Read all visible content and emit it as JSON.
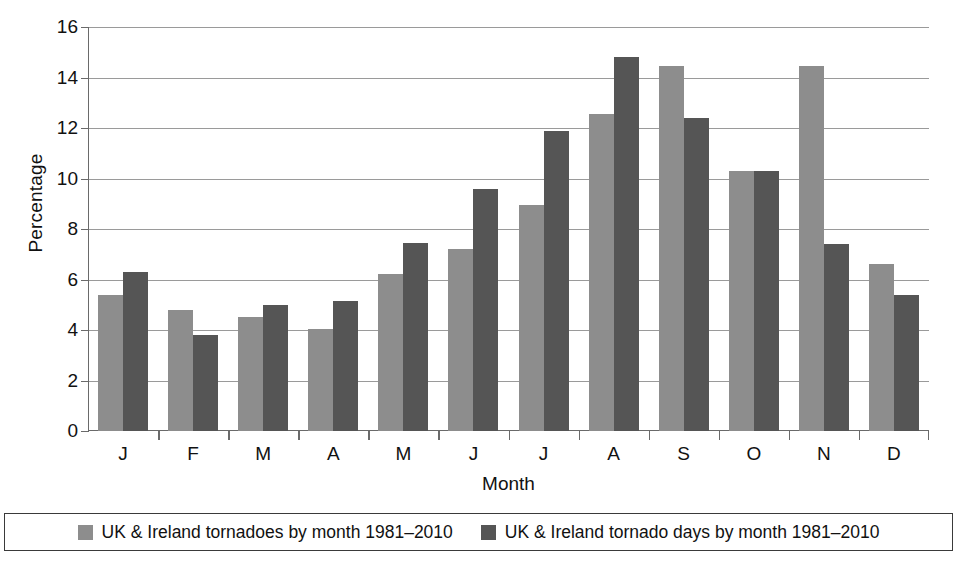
{
  "chart_data": {
    "type": "bar",
    "title": "",
    "xlabel": "Month",
    "ylabel": "Percentage",
    "categories": [
      "J",
      "F",
      "M",
      "A",
      "M",
      "J",
      "J",
      "A",
      "S",
      "O",
      "N",
      "D"
    ],
    "category_names": [
      "January",
      "February",
      "March",
      "April",
      "May",
      "June",
      "July",
      "August",
      "September",
      "October",
      "November",
      "December"
    ],
    "series": [
      {
        "name": "UK & Ireland tornadoes by month 1981–2010",
        "color": "#8d8d8d",
        "values": [
          5.4,
          4.8,
          4.5,
          4.05,
          6.2,
          7.2,
          8.95,
          12.55,
          14.45,
          10.3,
          14.45,
          6.6
        ]
      },
      {
        "name": "UK & Ireland tornado days by month 1981–2010",
        "color": "#555555",
        "values": [
          6.3,
          3.8,
          5.0,
          5.15,
          7.45,
          9.6,
          11.9,
          14.8,
          12.4,
          10.3,
          7.4,
          5.4
        ]
      }
    ],
    "ylim": [
      0,
      16
    ],
    "yticks": [
      0,
      2,
      4,
      6,
      8,
      10,
      12,
      14,
      16
    ],
    "ytick_labels": [
      "0",
      "2",
      "4",
      "6",
      "8",
      "10",
      "12",
      "14",
      "16"
    ],
    "grid": true,
    "legend_position": "bottom"
  },
  "legend": {
    "entries": [
      {
        "label": "UK & Ireland tornadoes by month 1981–2010"
      },
      {
        "label": "UK & Ireland tornado days by month 1981–2010"
      }
    ]
  }
}
